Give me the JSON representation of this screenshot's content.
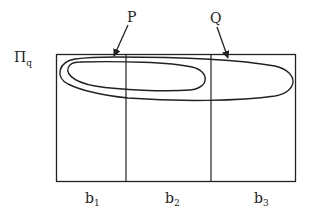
{
  "diagram": {
    "row_label": {
      "main": "Π",
      "sub": "q"
    },
    "pointers": [
      {
        "id": "P",
        "label": "P"
      },
      {
        "id": "Q",
        "label": "Q"
      }
    ],
    "columns": [
      {
        "main": "b",
        "sub": "1"
      },
      {
        "main": "b",
        "sub": "2"
      },
      {
        "main": "b",
        "sub": "3"
      }
    ],
    "colors": {
      "stroke": "#222222",
      "background": "#ffffff"
    }
  }
}
